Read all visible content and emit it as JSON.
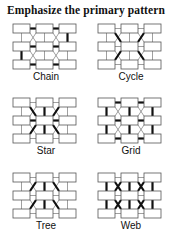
{
  "title": "Emphasize the primary pattern",
  "colors": {
    "box_stroke": "#555555",
    "thin_line": "#777777",
    "bold_line": "#111111"
  },
  "grid": {
    "rows": 3,
    "cols": 3,
    "box_w": 17,
    "box_h": 9,
    "gap_x": 6,
    "gap_y": 9
  },
  "panels": [
    {
      "id": "chain",
      "label": "Chain",
      "x": 10,
      "y": 22,
      "bold": [
        [
          [
            0,
            0
          ],
          [
            0,
            1
          ]
        ],
        [
          [
            0,
            1
          ],
          [
            0,
            2
          ]
        ],
        [
          [
            0,
            2
          ],
          [
            1,
            2
          ]
        ],
        [
          [
            1,
            2
          ],
          [
            1,
            1
          ]
        ],
        [
          [
            1,
            1
          ],
          [
            1,
            0
          ]
        ],
        [
          [
            1,
            0
          ],
          [
            2,
            0
          ]
        ],
        [
          [
            2,
            0
          ],
          [
            2,
            1
          ]
        ],
        [
          [
            2,
            1
          ],
          [
            2,
            2
          ]
        ]
      ]
    },
    {
      "id": "cycle",
      "label": "Cycle",
      "x": 95,
      "y": 22,
      "bold": [
        [
          [
            0,
            0
          ],
          [
            1,
            1
          ]
        ],
        [
          [
            0,
            2
          ],
          [
            1,
            1
          ]
        ],
        [
          [
            1,
            1
          ],
          [
            2,
            0
          ]
        ],
        [
          [
            1,
            1
          ],
          [
            2,
            2
          ]
        ]
      ],
      "bold_mode": "cycle"
    },
    {
      "id": "star",
      "label": "Star",
      "x": 10,
      "y": 96,
      "bold": [
        [
          [
            1,
            1
          ],
          [
            0,
            0
          ]
        ],
        [
          [
            1,
            1
          ],
          [
            0,
            1
          ]
        ],
        [
          [
            1,
            1
          ],
          [
            0,
            2
          ]
        ],
        [
          [
            1,
            1
          ],
          [
            1,
            0
          ]
        ],
        [
          [
            1,
            1
          ],
          [
            1,
            2
          ]
        ],
        [
          [
            1,
            1
          ],
          [
            2,
            0
          ]
        ],
        [
          [
            1,
            1
          ],
          [
            2,
            1
          ]
        ],
        [
          [
            1,
            1
          ],
          [
            2,
            2
          ]
        ]
      ]
    },
    {
      "id": "grid",
      "label": "Grid",
      "x": 95,
      "y": 96,
      "bold": [
        [
          [
            0,
            0
          ],
          [
            0,
            1
          ]
        ],
        [
          [
            0,
            1
          ],
          [
            0,
            2
          ]
        ],
        [
          [
            1,
            0
          ],
          [
            1,
            1
          ]
        ],
        [
          [
            1,
            1
          ],
          [
            1,
            2
          ]
        ],
        [
          [
            2,
            0
          ],
          [
            2,
            1
          ]
        ],
        [
          [
            2,
            1
          ],
          [
            2,
            2
          ]
        ],
        [
          [
            0,
            0
          ],
          [
            1,
            0
          ]
        ],
        [
          [
            1,
            0
          ],
          [
            2,
            0
          ]
        ],
        [
          [
            0,
            1
          ],
          [
            1,
            1
          ]
        ],
        [
          [
            1,
            1
          ],
          [
            2,
            1
          ]
        ],
        [
          [
            0,
            2
          ],
          [
            1,
            2
          ]
        ],
        [
          [
            1,
            2
          ],
          [
            2,
            2
          ]
        ]
      ]
    },
    {
      "id": "tree",
      "label": "Tree",
      "x": 10,
      "y": 171,
      "bold": [
        [
          [
            0,
            1
          ],
          [
            1,
            0
          ]
        ],
        [
          [
            0,
            1
          ],
          [
            1,
            1
          ]
        ],
        [
          [
            0,
            1
          ],
          [
            1,
            2
          ]
        ],
        [
          [
            1,
            1
          ],
          [
            2,
            0
          ]
        ],
        [
          [
            1,
            1
          ],
          [
            2,
            1
          ]
        ],
        [
          [
            1,
            1
          ],
          [
            2,
            2
          ]
        ]
      ]
    },
    {
      "id": "web",
      "label": "Web",
      "x": 95,
      "y": 171,
      "bold": [
        [
          [
            0,
            0
          ],
          [
            1,
            0
          ]
        ],
        [
          [
            1,
            0
          ],
          [
            2,
            0
          ]
        ],
        [
          [
            0,
            1
          ],
          [
            1,
            1
          ]
        ],
        [
          [
            1,
            1
          ],
          [
            2,
            1
          ]
        ],
        [
          [
            0,
            2
          ],
          [
            1,
            2
          ]
        ],
        [
          [
            1,
            2
          ],
          [
            2,
            2
          ]
        ],
        [
          [
            0,
            0
          ],
          [
            1,
            1
          ]
        ],
        [
          [
            0,
            1
          ],
          [
            1,
            0
          ]
        ],
        [
          [
            0,
            1
          ],
          [
            1,
            2
          ]
        ],
        [
          [
            0,
            2
          ],
          [
            1,
            1
          ]
        ],
        [
          [
            1,
            0
          ],
          [
            2,
            1
          ]
        ],
        [
          [
            1,
            1
          ],
          [
            2,
            0
          ]
        ],
        [
          [
            1,
            1
          ],
          [
            2,
            2
          ]
        ],
        [
          [
            1,
            2
          ],
          [
            2,
            1
          ]
        ]
      ]
    }
  ]
}
